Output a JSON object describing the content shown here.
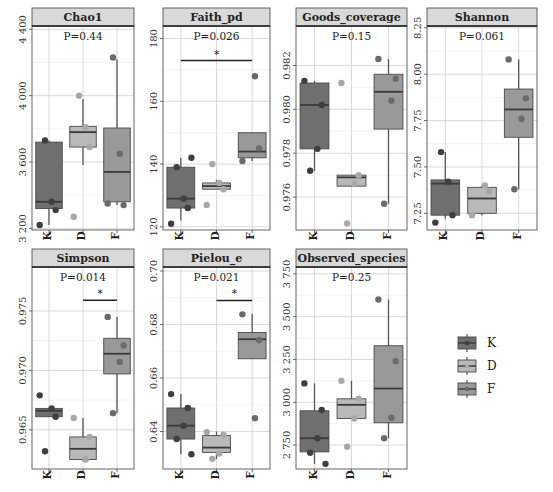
{
  "figure": {
    "colors": {
      "K": "#6f6f6f",
      "D": "#b9b9b9",
      "F": "#999999"
    },
    "point_colors": {
      "K": "#3f3f3f",
      "D": "#a8a8a8",
      "F": "#6a6a6a"
    },
    "strip_bg": "#d9d9d9",
    "grid_color": "#d6d6d6"
  },
  "legend": {
    "items": [
      {
        "label": "K",
        "key": "K"
      },
      {
        "label": "D",
        "key": "D"
      },
      {
        "label": "F",
        "key": "F"
      }
    ]
  },
  "chart_data": [
    {
      "type": "boxplot",
      "title": "Chao1",
      "p_label": "P=0.44",
      "ylim": [
        3190,
        4420
      ],
      "yticks": [
        3200,
        3600,
        4000,
        4400
      ],
      "ytick_labels": [
        "3 200",
        "3 600",
        "4 000",
        "4 400"
      ],
      "categories": [
        "K",
        "D",
        "F"
      ],
      "signif": null,
      "boxes": [
        {
          "group": "K",
          "min": 3220,
          "q1": 3320,
          "median": 3360,
          "q3": 3720,
          "max": 3730,
          "points": [
            3220,
            3310,
            3360,
            3730
          ]
        },
        {
          "group": "D",
          "min": 3580,
          "q1": 3690,
          "median": 3780,
          "q3": 3815,
          "max": 3980,
          "points": [
            3270,
            3690,
            3810,
            4000
          ]
        },
        {
          "group": "F",
          "min": 3340,
          "q1": 3360,
          "median": 3540,
          "q3": 3805,
          "max": 4220,
          "points": [
            3350,
            3340,
            3650,
            4230
          ]
        }
      ]
    },
    {
      "type": "boxplot",
      "title": "Faith_pd",
      "p_label": "P=0.026",
      "ylim": [
        119,
        184
      ],
      "yticks": [
        120,
        140,
        160,
        180
      ],
      "ytick_labels": [
        "120",
        "140",
        "160",
        "180"
      ],
      "categories": [
        "K",
        "D",
        "F"
      ],
      "signif": {
        "from": "K",
        "to": "F",
        "y": 173,
        "label": "*"
      },
      "boxes": [
        {
          "group": "K",
          "min": 122,
          "q1": 126,
          "median": 129,
          "q3": 139,
          "max": 142,
          "points": [
            121,
            126,
            129,
            139,
            142
          ]
        },
        {
          "group": "D",
          "min": 132,
          "q1": 132,
          "median": 133,
          "q3": 134,
          "max": 135,
          "points": [
            127,
            132,
            134,
            140
          ]
        },
        {
          "group": "F",
          "min": 141,
          "q1": 142,
          "median": 144,
          "q3": 150,
          "max": 150,
          "points": [
            141,
            145,
            168
          ]
        }
      ]
    },
    {
      "type": "boxplot",
      "title": "Goods_coverage",
      "p_label": "P=0.15",
      "ylim": [
        0.9745,
        0.9838
      ],
      "yticks": [
        0.976,
        0.978,
        0.98,
        0.982
      ],
      "ytick_labels": [
        "0.976",
        "0.978",
        "0.980",
        "0.982"
      ],
      "categories": [
        "K",
        "D",
        "F"
      ],
      "signif": null,
      "boxes": [
        {
          "group": "K",
          "min": 0.9772,
          "q1": 0.9782,
          "median": 0.9802,
          "q3": 0.9812,
          "max": 0.9813,
          "points": [
            0.9813,
            0.9802,
            0.9782,
            0.9772
          ]
        },
        {
          "group": "D",
          "min": 0.9765,
          "q1": 0.9765,
          "median": 0.9769,
          "q3": 0.977,
          "max": 0.977,
          "points": [
            0.9812,
            0.977,
            0.9766,
            0.9748
          ]
        },
        {
          "group": "F",
          "min": 0.9757,
          "q1": 0.9791,
          "median": 0.9808,
          "q3": 0.9816,
          "max": 0.9823,
          "points": [
            0.9823,
            0.9814,
            0.9804,
            0.9757
          ]
        }
      ]
    },
    {
      "type": "boxplot",
      "title": "Shannon",
      "p_label": "P=0.061",
      "ylim": [
        7.16,
        8.26
      ],
      "yticks": [
        7.25,
        7.5,
        7.75,
        8.0,
        8.25
      ],
      "ytick_labels": [
        "7.25",
        "7.50",
        "7.75",
        "8.00",
        "8.25"
      ],
      "categories": [
        "K",
        "D",
        "F"
      ],
      "signif": null,
      "boxes": [
        {
          "group": "K",
          "min": 7.22,
          "q1": 7.24,
          "median": 7.41,
          "q3": 7.43,
          "max": 7.58,
          "points": [
            7.2,
            7.24,
            7.42,
            7.58
          ]
        },
        {
          "group": "D",
          "min": 7.24,
          "q1": 7.25,
          "median": 7.33,
          "q3": 7.39,
          "max": 7.4,
          "points": [
            7.24,
            7.37,
            7.4
          ]
        },
        {
          "group": "F",
          "min": 7.38,
          "q1": 7.66,
          "median": 7.81,
          "q3": 7.92,
          "max": 8.08,
          "points": [
            8.08,
            7.87,
            7.76,
            7.38
          ]
        }
      ]
    },
    {
      "type": "boxplot",
      "title": "Simpson",
      "p_label": "P=0.014",
      "ylim": [
        0.9617,
        0.9787
      ],
      "yticks": [
        0.965,
        0.97,
        0.975
      ],
      "ytick_labels": [
        "0.965",
        "0.970",
        "0.975"
      ],
      "categories": [
        "K",
        "D",
        "F"
      ],
      "signif": {
        "from": "D",
        "to": "F",
        "y": 0.9759,
        "label": "*"
      },
      "boxes": [
        {
          "group": "K",
          "min": 0.9661,
          "q1": 0.9661,
          "median": 0.9666,
          "q3": 0.9668,
          "max": 0.9668,
          "points": [
            0.9679,
            0.9661,
            0.9668,
            0.9632
          ]
        },
        {
          "group": "D",
          "min": 0.9624,
          "q1": 0.9625,
          "median": 0.9634,
          "q3": 0.9644,
          "max": 0.966,
          "points": [
            0.966,
            0.9644,
            0.9625
          ]
        },
        {
          "group": "F",
          "min": 0.9664,
          "q1": 0.9697,
          "median": 0.9714,
          "q3": 0.9727,
          "max": 0.9745,
          "points": [
            0.9745,
            0.9721,
            0.9707,
            0.9664
          ]
        }
      ]
    },
    {
      "type": "boxplot",
      "title": "Pielou_e",
      "p_label": "P=0.021",
      "ylim": [
        0.626,
        0.7015
      ],
      "yticks": [
        0.64,
        0.66,
        0.68,
        0.7
      ],
      "ytick_labels": [
        "0.64",
        "0.66",
        "0.68",
        "0.70"
      ],
      "categories": [
        "K",
        "D",
        "F"
      ],
      "signif": {
        "from": "D",
        "to": "F",
        "y": 0.689,
        "label": "*"
      },
      "boxes": [
        {
          "group": "K",
          "min": 0.6315,
          "q1": 0.6372,
          "median": 0.6422,
          "q3": 0.6488,
          "max": 0.654,
          "points": [
            0.654,
            0.6488,
            0.6422,
            0.6372,
            0.6315
          ]
        },
        {
          "group": "D",
          "min": 0.6298,
          "q1": 0.6322,
          "median": 0.634,
          "q3": 0.6385,
          "max": 0.64,
          "points": [
            0.6398,
            0.6388,
            0.6318,
            0.6298
          ]
        },
        {
          "group": "F",
          "min": 0.6672,
          "q1": 0.6672,
          "median": 0.6745,
          "q3": 0.677,
          "max": 0.684,
          "points": [
            0.6838,
            0.6742,
            0.645
          ]
        }
      ]
    },
    {
      "type": "boxplot",
      "title": "Observed_species",
      "p_label": "P=0.25",
      "ylim": [
        2610,
        3790
      ],
      "yticks": [
        2750,
        3000,
        3250,
        3500,
        3750
      ],
      "ytick_labels": [
        "2 750",
        "3 000",
        "3 250",
        "3 500",
        "3 750"
      ],
      "categories": [
        "K",
        "D",
        "F"
      ],
      "signif": null,
      "boxes": [
        {
          "group": "K",
          "min": 2640,
          "q1": 2710,
          "median": 2790,
          "q3": 2950,
          "max": 3110,
          "points": [
            3110,
            2955,
            2790,
            2705,
            2640
          ]
        },
        {
          "group": "D",
          "min": 2905,
          "q1": 2905,
          "median": 2985,
          "q3": 3020,
          "max": 3125,
          "points": [
            3125,
            3020,
            2905,
            2740
          ]
        },
        {
          "group": "F",
          "min": 2790,
          "q1": 2880,
          "median": 3080,
          "q3": 3330,
          "max": 3600,
          "points": [
            3600,
            3240,
            2910,
            2790
          ]
        }
      ]
    }
  ]
}
